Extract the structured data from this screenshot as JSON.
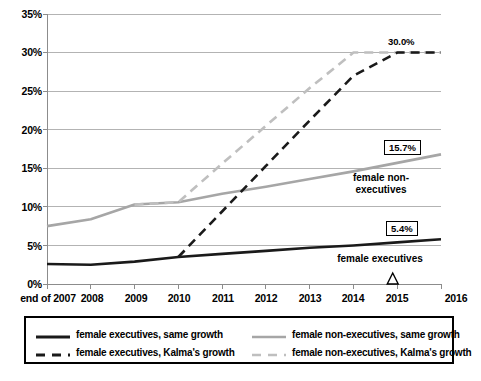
{
  "chart_data": {
    "type": "line",
    "title": "",
    "xlabel": "",
    "ylabel": "",
    "x": [
      "end of 2007",
      "2008",
      "2009",
      "2010",
      "2011",
      "2012",
      "2013",
      "2014",
      "2015",
      "2016"
    ],
    "x_tick_labels": [
      "end of 2007",
      "2008",
      "2009",
      "2010",
      "2011",
      "2012",
      "2013",
      "2014",
      "2015",
      "2016"
    ],
    "y_tick_labels": [
      "0%",
      "5%",
      "10%",
      "15%",
      "20%",
      "25%",
      "30%",
      "35%"
    ],
    "y_tick_values": [
      0,
      5,
      10,
      15,
      20,
      25,
      30,
      35
    ],
    "ylim": [
      0,
      35
    ],
    "grid": "horizontal",
    "legend_position": "below-plot",
    "series": [
      {
        "name": "female executives, same growth",
        "style": "solid",
        "color": "#1a1a1a",
        "width": 2.6,
        "x": [
          "end of 2007",
          "2008",
          "2009",
          "2010",
          "2011",
          "2012",
          "2013",
          "2014",
          "2015",
          "2016"
        ],
        "values": [
          2.6,
          2.5,
          2.9,
          3.5,
          3.9,
          4.3,
          4.7,
          5.0,
          5.4,
          5.8
        ]
      },
      {
        "name": "female non-executives, same growth",
        "style": "solid",
        "color": "#a6a6a6",
        "width": 2.6,
        "x": [
          "end of 2007",
          "2008",
          "2009",
          "2010",
          "2011",
          "2012",
          "2013",
          "2014",
          "2015",
          "2016"
        ],
        "values": [
          7.5,
          8.4,
          10.3,
          10.6,
          11.7,
          12.6,
          13.6,
          14.6,
          15.7,
          16.8
        ]
      },
      {
        "name": "female executives, Kalma's growth",
        "style": "dashed",
        "color": "#1a1a1a",
        "width": 2.6,
        "x": [
          "2010",
          "2011",
          "2012",
          "2013",
          "2014",
          "2015",
          "2016"
        ],
        "values": [
          3.5,
          9.4,
          15.3,
          21.2,
          27.0,
          30.0,
          30.0
        ]
      },
      {
        "name": "female non-executives, Kalma's growth",
        "style": "dashed",
        "color": "#bfbfbf",
        "width": 2.6,
        "x": [
          "2009",
          "2010",
          "2011",
          "2012",
          "2013",
          "2014",
          "2015",
          "2016"
        ],
        "values": [
          10.3,
          10.6,
          15.6,
          20.5,
          25.4,
          30.0,
          30.0,
          30.0
        ]
      }
    ],
    "annotations": [
      {
        "text": "30.0%",
        "value": 30.0,
        "boxed": false,
        "at_x": "2014"
      },
      {
        "text": "15.7%",
        "value": 15.7,
        "boxed": true,
        "at_x": "2015"
      },
      {
        "text": "5.4%",
        "value": 5.4,
        "boxed": true,
        "at_x": "2015"
      },
      {
        "text": "female non-executives",
        "boxed": false
      },
      {
        "text": "female executives",
        "boxed": false
      }
    ],
    "markers": [
      {
        "name": "triangle-marker",
        "axis": "x",
        "near": "2015",
        "shape": "triangle-outline"
      }
    ]
  },
  "axis": {
    "y_labels": [
      "35%",
      "30%",
      "25%",
      "20%",
      "15%",
      "10%",
      "5%",
      "0%"
    ],
    "x_labels": [
      "end of 2007",
      "2008",
      "2009",
      "2010",
      "2011",
      "2012",
      "2013",
      "2014",
      "2015",
      "2016"
    ]
  },
  "annotations": {
    "peak_label": "30.0%",
    "nonexec_value_box": "15.7%",
    "exec_value_box": "5.4%",
    "nonexec_line1": "female non-",
    "nonexec_line2": "executives",
    "exec_label": "female executives"
  },
  "legend": {
    "entries": [
      {
        "label": "female executives, same growth",
        "style": "solid",
        "color": "#1a1a1a"
      },
      {
        "label": "female non-executives, same growth",
        "style": "solid",
        "color": "#a6a6a6"
      },
      {
        "label": "female executives, Kalma's growth",
        "style": "dashed",
        "color": "#1a1a1a"
      },
      {
        "label": "female non-executives, Kalma's growth",
        "style": "dashed",
        "color": "#bfbfbf"
      }
    ]
  },
  "colors": {
    "exec_series": "#1a1a1a",
    "nonexec_series": "#a6a6a6",
    "nonexec_dashed": "#bfbfbf",
    "gridline": "#b3b3b3",
    "axis": "#8c8c8c",
    "background": "#ffffff"
  }
}
